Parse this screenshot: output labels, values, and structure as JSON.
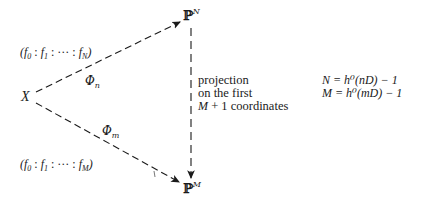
{
  "nodes": {
    "source": {
      "label": "X"
    },
    "target_top": {
      "base": "ℙ",
      "sup": "N"
    },
    "target_bottom": {
      "base": "ℙ",
      "sup": "M"
    }
  },
  "arrows": {
    "upper": {
      "label_base": "Φ",
      "label_sub": "n",
      "coords": "(f₀ : f₁ : ··· : f_N)",
      "style": "dashed"
    },
    "lower": {
      "label_base": "Φ",
      "label_sub": "m",
      "coords": "(f₀ : f₁ : ··· : f_M)",
      "style": "dashed"
    },
    "vertical": {
      "style": "dashed"
    }
  },
  "vertical_label": {
    "line1": "projection",
    "line2": "on the first",
    "line3_math": "M",
    "line3_rest": "+ 1 coordinates"
  },
  "equations": {
    "eq1": "N = h⁰(nD) − 1",
    "eq2": "M = h⁰(mD) − 1"
  },
  "coords_text": {
    "upper_prefix": "(f",
    "upper": [
      "(",
      "f",
      "0",
      " : ",
      "f",
      "1",
      " : ··· : ",
      "f",
      "N",
      ")"
    ],
    "lower": [
      "(",
      "f",
      "0",
      " : ",
      "f",
      "1",
      " : ··· : ",
      "f",
      "M",
      ")"
    ]
  }
}
